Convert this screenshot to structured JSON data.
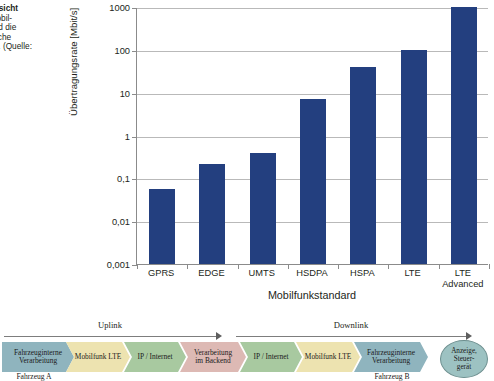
{
  "caption": {
    "lines": [
      "9.4  Übersicht",
      "baren Mobil-",
      "dards und die",
      "theoretische",
      "ungsrate. (Quelle:",
      "up)"
    ],
    "bold_prefix": "9.4"
  },
  "chart_data": {
    "type": "bar",
    "title": "",
    "categories": [
      "GPRS",
      "EDGE",
      "UMTS",
      "HSDPA",
      "HSPA",
      "LTE",
      "LTE\nAdvanced"
    ],
    "category_labels": [
      [
        "GPRS"
      ],
      [
        "EDGE"
      ],
      [
        "UMTS"
      ],
      [
        "HSDPA"
      ],
      [
        "HSPA"
      ],
      [
        "LTE"
      ],
      [
        "LTE",
        "Advanced"
      ]
    ],
    "values": [
      0.056,
      0.22,
      0.384,
      7.2,
      40,
      100,
      1000
    ],
    "xlabel": "Mobilfunkstandard",
    "ylabel": "Übertragungsrate [Mbit/s]",
    "yscale": "log",
    "ylim": [
      0.001,
      1000
    ],
    "ytick_labels": [
      "1000",
      "100",
      "10",
      "1",
      "0,1",
      "0,01",
      "0,001"
    ],
    "ytick_values": [
      1000,
      100,
      10,
      1,
      0.1,
      0.01,
      0.001
    ],
    "grid": true,
    "legend": "none",
    "bar_color": "#233f7f",
    "grid_color": "#b9b9b9",
    "axis_color": "#8b8b8b"
  },
  "flow": {
    "arrows": [
      {
        "label": "Uplink",
        "x": 4,
        "width": 212
      },
      {
        "label": "Downlink",
        "x": 236,
        "width": 230
      }
    ],
    "nodes": [
      {
        "label_lines": [
          "Fahrzeuginterne",
          "Verarbeitung"
        ],
        "color": "#8fb4be",
        "border": "#5f8893",
        "x": 2,
        "width": 72
      },
      {
        "label_lines": [
          "Mobilfunk LTE"
        ],
        "color": "#ede3b0",
        "border": "#c3b87e",
        "x": 66,
        "width": 64
      },
      {
        "label_lines": [
          "IP / Internet"
        ],
        "color": "#a8c9a0",
        "border": "#7ba272",
        "x": 124,
        "width": 62
      },
      {
        "label_lines": [
          "Verarbeitung",
          "im Backend"
        ],
        "color": "#ddb9b4",
        "border": "#b58d88",
        "x": 180,
        "width": 66
      },
      {
        "label_lines": [
          "IP / Internet"
        ],
        "color": "#a8c9a0",
        "border": "#7ba272",
        "x": 240,
        "width": 62
      },
      {
        "label_lines": [
          "Mobilfunk LTE"
        ],
        "color": "#ede3b0",
        "border": "#c3b87e",
        "x": 296,
        "width": 64
      },
      {
        "label_lines": [
          "Fahrzeuginterne",
          "Verarbeitung"
        ],
        "color": "#8fb4be",
        "border": "#5f8893",
        "x": 354,
        "width": 74
      }
    ],
    "terminal": {
      "label_lines": [
        "Anzeige,",
        "Steuer-",
        "gerät"
      ],
      "color": "#9dc2c2",
      "x": 440
    },
    "vehicle_labels": [
      {
        "text": "Fahrzeug A",
        "x": 34,
        "y": 52
      },
      {
        "text": "Fahrzeug B",
        "x": 392,
        "y": 52
      }
    ]
  }
}
